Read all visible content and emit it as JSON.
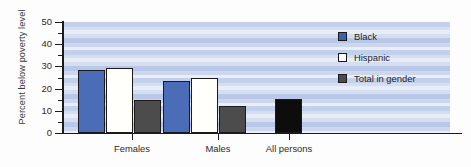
{
  "chart_data": {
    "type": "bar",
    "title": "",
    "xlabel": "",
    "ylabel": "Percent below poverty level",
    "ylim": [
      0,
      50
    ],
    "grid": false,
    "legend_position": "inside-right",
    "categories": [
      "Females",
      "Males",
      "All persons"
    ],
    "y_ticks_major": [
      "0",
      "10",
      "20",
      "30",
      "40",
      "50"
    ],
    "y_ticks_major_values": [
      0,
      10,
      20,
      30,
      40,
      50
    ],
    "y_ticks_minor_values": [
      5,
      15,
      25,
      35,
      45
    ],
    "series": [
      {
        "name": "Black",
        "color": "#4b6cb7",
        "values": [
          28.5,
          23.5,
          null
        ]
      },
      {
        "name": "Hispanic",
        "color": "#ffffff",
        "values": [
          29.5,
          25.0,
          null
        ]
      },
      {
        "name": "Total in gender",
        "color": "#4c4c4c",
        "values": [
          15.0,
          12.0,
          15.5
        ]
      }
    ],
    "bars": [
      {
        "group": "Females",
        "series": "Black",
        "value": 28.5,
        "fill": "black-series"
      },
      {
        "group": "Females",
        "series": "Hispanic",
        "value": 29.5,
        "fill": "hispanic-series"
      },
      {
        "group": "Females",
        "series": "Total in gender",
        "value": 15.0,
        "fill": "total-series"
      },
      {
        "group": "Males",
        "series": "Black",
        "value": 23.5,
        "fill": "black-series"
      },
      {
        "group": "Males",
        "series": "Hispanic",
        "value": 25.0,
        "fill": "hispanic-series"
      },
      {
        "group": "Males",
        "series": "Total in gender",
        "value": 12.0,
        "fill": "total-series"
      },
      {
        "group": "All persons",
        "series": "Total in gender",
        "value": 15.5,
        "fill": "allpersons"
      }
    ]
  },
  "legend": {
    "items": [
      {
        "label": "Black",
        "swatch": "black-series"
      },
      {
        "label": "Hispanic",
        "swatch": "hispanic-series"
      },
      {
        "label": "Total in gender",
        "swatch": "total-series"
      }
    ]
  },
  "axes": {
    "y_title": "Percent below poverty level"
  }
}
